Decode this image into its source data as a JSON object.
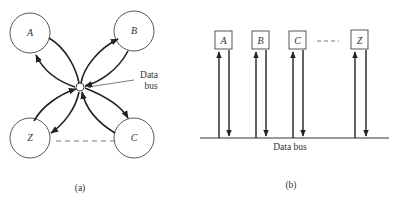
{
  "figure_a": {
    "nodes": [
      {
        "id": "A",
        "label": "A",
        "cx": 30,
        "cy": 33
      },
      {
        "id": "B",
        "label": "B",
        "cx": 134,
        "cy": 31
      },
      {
        "id": "Z",
        "label": "Z",
        "cx": 30,
        "cy": 138
      },
      {
        "id": "C",
        "label": "C",
        "cx": 134,
        "cy": 138
      }
    ],
    "hub_label_line1": "Data",
    "hub_label_line2": "bus",
    "caption": "(a)"
  },
  "figure_b": {
    "nodes": [
      {
        "id": "A",
        "label": "A"
      },
      {
        "id": "B",
        "label": "B"
      },
      {
        "id": "C",
        "label": "C"
      },
      {
        "id": "Z",
        "label": "Z"
      }
    ],
    "bus_label": "Data bus",
    "caption": "(b)"
  },
  "colors": {
    "line": "#222222",
    "text": "#333333",
    "background": "#ffffff"
  }
}
